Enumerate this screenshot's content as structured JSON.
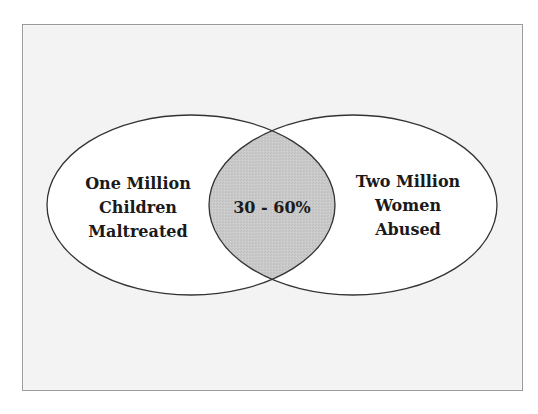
{
  "diagram": {
    "type": "venn",
    "colors": {
      "background": "#f3f3f3",
      "frame_border": "#9a9a9a",
      "circle_fill": "#ffffff",
      "circle_stroke": "#333333",
      "overlap_fill": "#c9c9c9",
      "text": "#1a1a1a"
    },
    "left_set": {
      "lines": [
        "One Million",
        "Children",
        "Maltreated"
      ]
    },
    "right_set": {
      "lines": [
        "Two Million",
        "Women",
        "Abused"
      ]
    },
    "overlap": {
      "label": "30 - 60%"
    }
  }
}
